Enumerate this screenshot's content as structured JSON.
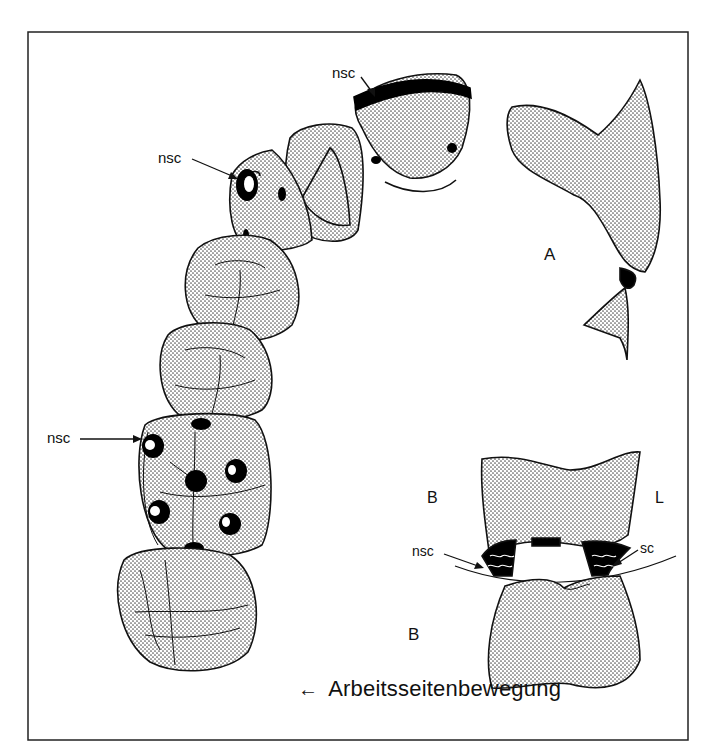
{
  "figure": {
    "labels": {
      "nsc_top": "nsc",
      "nsc_premolar": "nsc",
      "nsc_molar": "nsc",
      "view_a": "A",
      "view_b": "B",
      "side_b": "B",
      "side_l": "L",
      "nsc_cross": "nsc",
      "sc_cross": "sc"
    },
    "caption": {
      "arrow": "←",
      "text": "Arbeitsseitenbewegung"
    },
    "colors": {
      "stroke": "#111111",
      "stipple": "#555555",
      "fill_background": "#ffffff",
      "contact": "#000000"
    }
  }
}
